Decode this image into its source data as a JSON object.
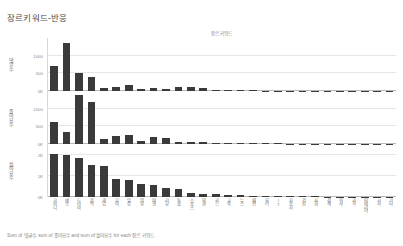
{
  "title": "장르키워드-반응",
  "column_header": "장르 키워드",
  "caption": "Sum of 댓글수, sum of 좋아요수 and sum of 싫어요수 for each 장르 키워드.",
  "colors": {
    "bar": "#3a3a3a",
    "grid": "#e6e6e6",
    "axis": "#b9b9b9",
    "text": "#7a7a7a"
  },
  "chart_data": {
    "type": "bar",
    "title": "장르키워드-반응",
    "xlabel": "장르 키워드",
    "grid": true,
    "legend": "none",
    "categories": [
      "코미디",
      "예능",
      "드라마",
      "음악",
      "게임",
      "뷰티",
      "일상",
      "먹방",
      "여행",
      "리뷰",
      "동물",
      "스포츠",
      "영화",
      "키즈",
      "교육",
      "뉴스",
      "패션",
      "요리",
      "IT",
      "자동차",
      "건강",
      "사회",
      "경제",
      "역사",
      "과학",
      "인테리어",
      "시사",
      "기타"
    ],
    "series": [
      {
        "name": "댓글수",
        "ylabel": "댓글수",
        "ylim": [
          0,
          1500
        ],
        "yticks": [
          0,
          500,
          1000
        ],
        "ytick_labels": [
          "0K",
          "500",
          "1000"
        ],
        "values": [
          700,
          1350,
          520,
          400,
          90,
          110,
          170,
          70,
          80,
          45,
          105,
          100,
          80,
          25,
          20,
          18,
          15,
          12,
          10,
          9,
          8,
          7,
          6,
          5,
          4,
          4,
          3,
          3
        ]
      },
      {
        "name": "좋아요수",
        "ylabel": "좋아요수",
        "ylim": [
          0,
          1500
        ],
        "yticks": [
          0,
          500,
          1000
        ],
        "ytick_labels": [
          "0K",
          "500",
          "1000"
        ],
        "values": [
          620,
          330,
          1380,
          1180,
          130,
          230,
          260,
          95,
          185,
          175,
          60,
          55,
          45,
          40,
          35,
          28,
          22,
          18,
          15,
          12,
          10,
          9,
          8,
          7,
          6,
          5,
          4,
          4
        ]
      },
      {
        "name": "싫어요수",
        "ylabel": "싫어요수",
        "ylim": [
          0,
          2500
        ],
        "yticks": [
          0,
          1000,
          2000
        ],
        "ytick_labels": [
          "0K",
          "1K",
          "2K"
        ],
        "values": [
          2050,
          2000,
          1830,
          1500,
          1480,
          830,
          790,
          600,
          580,
          420,
          390,
          200,
          150,
          120,
          95,
          80,
          65,
          55,
          45,
          38,
          32,
          27,
          22,
          18,
          15,
          12,
          10,
          8
        ]
      }
    ]
  }
}
